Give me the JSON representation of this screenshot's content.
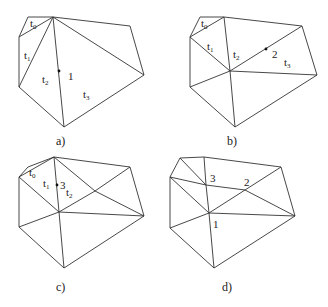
{
  "panels": [
    {
      "caption": "a)",
      "vertices": {
        "A": [
          28,
          17
        ],
        "B": [
          53,
          17
        ],
        "C": [
          19,
          37
        ],
        "D": [
          130,
          26
        ],
        "E": [
          144,
          75
        ],
        "F": [
          19,
          87
        ],
        "G": [
          64,
          127
        ]
      },
      "edges": [
        [
          "A",
          "B"
        ],
        [
          "A",
          "C"
        ],
        [
          "C",
          "B"
        ],
        [
          "C",
          "F"
        ],
        [
          "F",
          "B"
        ],
        [
          "F",
          "G"
        ],
        [
          "B",
          "G"
        ],
        [
          "G",
          "E"
        ],
        [
          "B",
          "E"
        ],
        [
          "B",
          "D"
        ],
        [
          "D",
          "E"
        ]
      ],
      "points": [
        {
          "id": "1",
          "pos": [
            59,
            71
          ],
          "label": "1",
          "label_pos": [
            68,
            80
          ]
        }
      ],
      "triangle_labels": [
        {
          "t": "t",
          "s": "0",
          "pos": [
            30,
            27
          ]
        },
        {
          "t": "t",
          "s": "1",
          "pos": [
            24,
            59
          ]
        },
        {
          "t": "t",
          "s": "2",
          "pos": [
            42,
            83
          ]
        },
        {
          "t": "t",
          "s": "3",
          "pos": [
            83,
            98
          ]
        }
      ]
    },
    {
      "caption": "b)",
      "vertices": {
        "A": [
          200,
          17
        ],
        "B": [
          224,
          17
        ],
        "C": [
          190,
          37
        ],
        "D": [
          302,
          26
        ],
        "E": [
          317,
          75
        ],
        "F": [
          190,
          87
        ],
        "G": [
          235,
          127
        ],
        "P1": [
          230,
          71
        ]
      },
      "edges": [
        [
          "A",
          "B"
        ],
        [
          "A",
          "C"
        ],
        [
          "C",
          "B"
        ],
        [
          "C",
          "F"
        ],
        [
          "F",
          "G"
        ],
        [
          "G",
          "E"
        ],
        [
          "B",
          "D"
        ],
        [
          "D",
          "E"
        ],
        [
          "C",
          "P1"
        ],
        [
          "B",
          "P1"
        ],
        [
          "F",
          "P1"
        ],
        [
          "G",
          "P1"
        ],
        [
          "E",
          "P1"
        ],
        [
          "D",
          "P1"
        ]
      ],
      "points": [
        {
          "id": "2",
          "pos": [
            266,
            49
          ],
          "label": "2",
          "label_pos": [
            272,
            58
          ]
        }
      ],
      "triangle_labels": [
        {
          "t": "t",
          "s": "0",
          "pos": [
            201,
            27
          ]
        },
        {
          "t": "t",
          "s": "1",
          "pos": [
            207,
            50
          ]
        },
        {
          "t": "t",
          "s": "2",
          "pos": [
            233,
            58
          ]
        },
        {
          "t": "t",
          "s": "3",
          "pos": [
            284,
            66
          ]
        }
      ]
    },
    {
      "caption": "c)",
      "vertices": {
        "A": [
          28,
          167
        ],
        "B": [
          54,
          157
        ],
        "C": [
          19,
          177
        ],
        "D": [
          130,
          167
        ],
        "E": [
          144,
          216
        ],
        "F": [
          19,
          227
        ],
        "G": [
          64,
          268
        ],
        "P1": [
          59,
          212
        ],
        "P2": [
          95,
          191
        ]
      },
      "edges": [
        [
          "A",
          "B"
        ],
        [
          "A",
          "C"
        ],
        [
          "C",
          "B"
        ],
        [
          "C",
          "F"
        ],
        [
          "F",
          "G"
        ],
        [
          "G",
          "E"
        ],
        [
          "B",
          "D"
        ],
        [
          "D",
          "E"
        ],
        [
          "C",
          "P1"
        ],
        [
          "B",
          "P1"
        ],
        [
          "F",
          "P1"
        ],
        [
          "G",
          "P1"
        ],
        [
          "E",
          "P1"
        ],
        [
          "P1",
          "P2"
        ],
        [
          "P2",
          "D"
        ],
        [
          "P2",
          "E"
        ],
        [
          "B",
          "P2"
        ]
      ],
      "points": [
        {
          "id": "3",
          "pos": [
            57,
            185
          ],
          "label": "3",
          "label_pos": [
            60,
            189
          ]
        }
      ],
      "triangle_labels": [
        {
          "t": "t",
          "s": "0",
          "pos": [
            29,
            176
          ]
        },
        {
          "t": "t",
          "s": "1",
          "pos": [
            43,
            187
          ]
        },
        {
          "t": "t",
          "s": "2",
          "pos": [
            66,
            196
          ]
        }
      ]
    },
    {
      "caption": "d)",
      "vertices": {
        "A": [
          180,
          158
        ],
        "B": [
          204,
          157
        ],
        "C": [
          170,
          177
        ],
        "D": [
          281,
          167
        ],
        "E": [
          295,
          216
        ],
        "F": [
          170,
          228
        ],
        "G": [
          214,
          268
        ],
        "P1": [
          209,
          213
        ],
        "P2": [
          245,
          190
        ],
        "P3": [
          206,
          185
        ]
      },
      "edges": [
        [
          "A",
          "B"
        ],
        [
          "A",
          "C"
        ],
        [
          "C",
          "F"
        ],
        [
          "F",
          "G"
        ],
        [
          "G",
          "E"
        ],
        [
          "B",
          "D"
        ],
        [
          "D",
          "E"
        ],
        [
          "F",
          "P1"
        ],
        [
          "G",
          "P1"
        ],
        [
          "E",
          "P1"
        ],
        [
          "P1",
          "P2"
        ],
        [
          "P2",
          "D"
        ],
        [
          "P2",
          "E"
        ],
        [
          "A",
          "P3"
        ],
        [
          "B",
          "P3"
        ],
        [
          "C",
          "P3"
        ],
        [
          "P3",
          "P1"
        ],
        [
          "C",
          "P1"
        ],
        [
          "P3",
          "P2"
        ]
      ],
      "points": [],
      "point_labels": [
        {
          "label": "3",
          "pos": [
            210,
            182
          ]
        },
        {
          "label": "2",
          "pos": [
            244,
            186
          ]
        },
        {
          "label": "1",
          "pos": [
            213,
            228
          ]
        }
      ],
      "triangle_labels": []
    }
  ],
  "captions_pos": [
    [
      56,
      145
    ],
    [
      227,
      145
    ],
    [
      56,
      291
    ],
    [
      222,
      291
    ]
  ]
}
